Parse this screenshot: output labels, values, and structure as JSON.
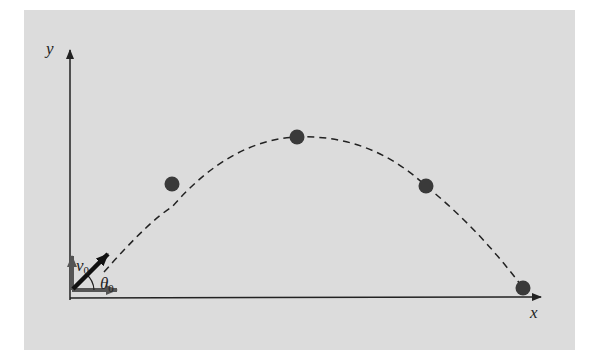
{
  "diagram": {
    "type": "projectile-motion",
    "background_color": "#dcdcdc",
    "axes": {
      "x_label": "x",
      "y_label": "y"
    },
    "initial_velocity": {
      "symbol": "v",
      "subscript": "0"
    },
    "launch_angle": {
      "symbol": "θ",
      "subscript": "0"
    },
    "trajectory": {
      "style": "dashed",
      "points": [
        {
          "x": 172,
          "y": 184
        },
        {
          "x": 297,
          "y": 137
        },
        {
          "x": 426,
          "y": 186
        },
        {
          "x": 523,
          "y": 288
        }
      ]
    },
    "colors": {
      "axis": "#222222",
      "component_arrows": "#555555",
      "velocity_arrow": "#111111",
      "dots": "#3a3a3a"
    }
  }
}
